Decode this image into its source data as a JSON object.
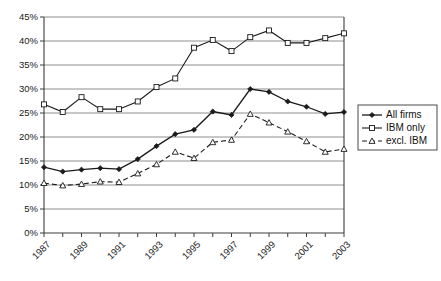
{
  "chart_data": {
    "type": "line",
    "title": "",
    "xlabel": "",
    "ylabel": "",
    "grid": "horizontal",
    "legend_position": "right",
    "x": [
      1987,
      1988,
      1989,
      1990,
      1991,
      1992,
      1993,
      1994,
      1995,
      1996,
      1997,
      1998,
      1999,
      2000,
      2001,
      2002,
      2003
    ],
    "xtick_labels": [
      "1987",
      "1989",
      "1991",
      "1993",
      "1995",
      "1997",
      "1999",
      "2001",
      "2003"
    ],
    "xtick_values": [
      1987,
      1989,
      1991,
      1993,
      1995,
      1997,
      1999,
      2001,
      2003
    ],
    "ylim": [
      0,
      45
    ],
    "ytick_labels": [
      "0%",
      "5%",
      "10%",
      "15%",
      "20%",
      "25%",
      "30%",
      "35%",
      "40%",
      "45%"
    ],
    "ytick_values": [
      0,
      5,
      10,
      15,
      20,
      25,
      30,
      35,
      40,
      45
    ],
    "series": [
      {
        "name": "All firms",
        "marker": "filled-diamond",
        "line_style": "solid",
        "values": [
          13.7,
          12.8,
          13.2,
          13.5,
          13.3,
          15.4,
          18.1,
          20.6,
          21.5,
          25.3,
          24.6,
          30.0,
          29.4,
          27.4,
          26.3,
          24.8,
          25.2
        ]
      },
      {
        "name": "IBM only",
        "marker": "open-square",
        "line_style": "solid",
        "values": [
          26.8,
          25.2,
          28.3,
          25.8,
          25.8,
          27.4,
          30.4,
          32.2,
          38.6,
          40.2,
          37.9,
          40.8,
          42.2,
          39.6,
          39.6,
          40.6,
          41.6
        ]
      },
      {
        "name": "excl. IBM",
        "marker": "open-triangle",
        "line_style": "dashed",
        "values": [
          10.4,
          9.9,
          10.2,
          10.7,
          10.6,
          12.4,
          14.3,
          16.9,
          15.6,
          18.9,
          19.4,
          24.8,
          23.0,
          21.1,
          19.1,
          16.9,
          17.5
        ]
      }
    ]
  },
  "legend": {
    "items": [
      {
        "label": "All firms"
      },
      {
        "label": "IBM only"
      },
      {
        "label": "excl. IBM"
      }
    ]
  }
}
